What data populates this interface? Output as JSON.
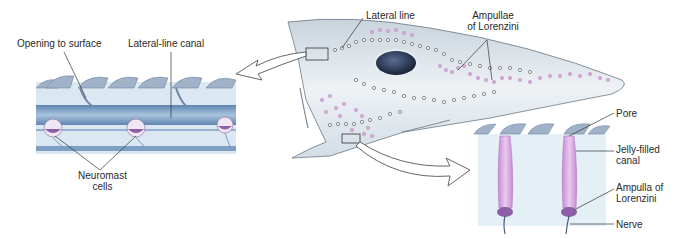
{
  "diagram": {
    "labels": {
      "opening_to_surface": "Opening to surface",
      "lateral_line_canal": "Lateral-line canal",
      "lateral_line": "Lateral line",
      "ampullae_line1": "Ampullae",
      "ampullae_line2": "of Lorenzini",
      "neuromast_line1": "Neuromast",
      "neuromast_line2": "cells",
      "pore": "Pore",
      "jelly_line1": "Jelly-filled",
      "jelly_line2": "canal",
      "ampulla_line1": "Ampulla of",
      "ampulla_line2": "Lorenzini",
      "nerve": "Nerve"
    },
    "colors": {
      "skin_blue": "#c9dcea",
      "canal_blue": "#7d9fc4",
      "denticle": "#8ea4bd",
      "shark_body": "#dfe8ee",
      "ampullae_pink": "#d8a8d8",
      "eye": "#1f2e4a",
      "line": "#333333"
    }
  }
}
